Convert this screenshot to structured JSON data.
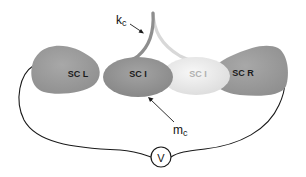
{
  "diagram": {
    "type": "semicircular-canal-schematic",
    "elements": {
      "sc_left": {
        "label": "SC L",
        "color": "#9a9a9a"
      },
      "sc_inner_dark": {
        "label": "SC I",
        "color": "#8c8c8c"
      },
      "sc_inner_light": {
        "label": "SC I",
        "color": "#ececec"
      },
      "sc_right": {
        "label": "SC R",
        "color": "#9a9a9a"
      },
      "coupling_spring": {
        "label": "k",
        "subscript": "c"
      },
      "coupling_mass": {
        "label": "m",
        "subscript": "c"
      },
      "voltmeter": {
        "label": "V"
      }
    },
    "colors": {
      "background": "#ffffff",
      "wire": "#1a1a1a",
      "spring_dark": "#8a8a8a",
      "spring_light": "#d6d6d6"
    }
  }
}
